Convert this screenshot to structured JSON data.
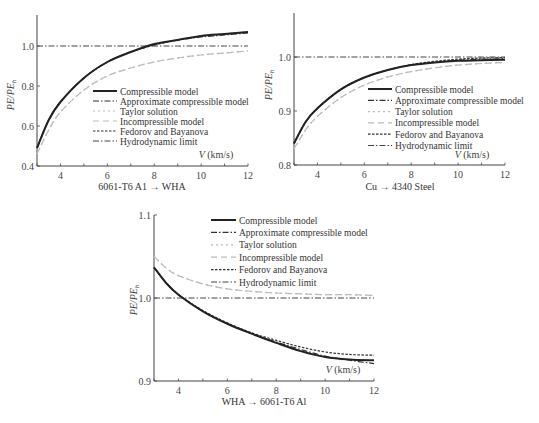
{
  "legend": [
    {
      "label": "Compressible model",
      "style": "solid",
      "color": "#222222",
      "width": 2
    },
    {
      "label": "Approximate compressible model",
      "style": "dashdot",
      "color": "#333333",
      "width": 1.2
    },
    {
      "label": "Taylor solution",
      "style": "dotted",
      "color": "#bbbbbb",
      "width": 1.2
    },
    {
      "label": "Incompressible model",
      "style": "dashed",
      "color": "#bbbbbb",
      "width": 1.2
    },
    {
      "label": "Fedorov and Bayanova",
      "style": "shortdash",
      "color": "#333333",
      "width": 1.2
    },
    {
      "label": "Hydrodynamic limit",
      "style": "dashdot",
      "color": "#444444",
      "width": 1
    }
  ],
  "chart_data": [
    {
      "type": "line",
      "title": "6061-T6 A1 → WHA",
      "xlabel": "V (km/s)",
      "ylabel": "PE/PE_h",
      "xlim": [
        3,
        12
      ],
      "ylim": [
        0.4,
        1.15
      ],
      "xticks": [
        4,
        6,
        8,
        10,
        12
      ],
      "yticks": [
        "0.4",
        "0.6",
        "0.8",
        "1.0"
      ],
      "grid": false,
      "legend_position": "lower right",
      "x": [
        3,
        3.5,
        4,
        5,
        6,
        7,
        8,
        9,
        10,
        11,
        12
      ],
      "series": [
        {
          "name": "Compressible model",
          "values": [
            0.49,
            0.63,
            0.72,
            0.84,
            0.92,
            0.97,
            1.01,
            1.03,
            1.05,
            1.06,
            1.07
          ]
        },
        {
          "name": "Approximate compressible model",
          "values": [
            0.49,
            0.63,
            0.72,
            0.84,
            0.92,
            0.97,
            1.005,
            1.03,
            1.045,
            1.055,
            1.065
          ]
        },
        {
          "name": "Taylor solution",
          "values": [
            0.46,
            0.58,
            0.67,
            0.78,
            0.85,
            0.89,
            0.92,
            0.94,
            0.955,
            0.965,
            0.975
          ]
        },
        {
          "name": "Incompressible model",
          "values": [
            0.46,
            0.58,
            0.67,
            0.78,
            0.85,
            0.89,
            0.92,
            0.94,
            0.955,
            0.965,
            0.975
          ]
        },
        {
          "name": "Fedorov and Bayanova",
          "values": [
            0.49,
            0.63,
            0.72,
            0.84,
            0.92,
            0.97,
            1.005,
            1.03,
            1.05,
            1.06,
            1.07
          ]
        },
        {
          "name": "Hydrodynamic limit",
          "values": [
            1.0,
            1.0,
            1.0,
            1.0,
            1.0,
            1.0,
            1.0,
            1.0,
            1.0,
            1.0,
            1.0
          ]
        }
      ]
    },
    {
      "type": "line",
      "title": "Cu → 4340 Steel",
      "xlabel": "V (km/s)",
      "ylabel": "PE/PE_h",
      "xlim": [
        3,
        12
      ],
      "ylim": [
        0.8,
        1.08
      ],
      "xticks": [
        4,
        6,
        8,
        10,
        12
      ],
      "yticks": [
        "0.8",
        "0.9",
        "1.0"
      ],
      "grid": false,
      "legend_position": "lower right",
      "x": [
        3,
        3.5,
        4,
        5,
        6,
        7,
        8,
        9,
        10,
        11,
        12
      ],
      "series": [
        {
          "name": "Compressible model",
          "values": [
            0.84,
            0.88,
            0.905,
            0.94,
            0.962,
            0.976,
            0.985,
            0.99,
            0.993,
            0.994,
            0.995
          ]
        },
        {
          "name": "Approximate compressible model",
          "values": [
            0.84,
            0.88,
            0.905,
            0.94,
            0.962,
            0.976,
            0.985,
            0.99,
            0.994,
            0.996,
            0.997
          ]
        },
        {
          "name": "Taylor solution",
          "values": [
            0.83,
            0.865,
            0.89,
            0.925,
            0.948,
            0.963,
            0.973,
            0.98,
            0.985,
            0.988,
            0.99
          ]
        },
        {
          "name": "Incompressible model",
          "values": [
            0.83,
            0.865,
            0.89,
            0.925,
            0.948,
            0.963,
            0.973,
            0.98,
            0.985,
            0.988,
            0.99
          ]
        },
        {
          "name": "Fedorov and Bayanova",
          "values": [
            0.84,
            0.88,
            0.905,
            0.94,
            0.962,
            0.976,
            0.986,
            0.992,
            0.996,
            0.998,
            0.999
          ]
        },
        {
          "name": "Hydrodynamic limit",
          "values": [
            1.0,
            1.0,
            1.0,
            1.0,
            1.0,
            1.0,
            1.0,
            1.0,
            1.0,
            1.0,
            1.0
          ]
        }
      ]
    },
    {
      "type": "line",
      "title": "WHA → 6061-T6 Al",
      "xlabel": "V (km/s)",
      "ylabel": "PE/PE_h",
      "xlim": [
        3,
        12
      ],
      "ylim": [
        0.9,
        1.1
      ],
      "xticks": [
        4,
        6,
        8,
        10,
        12
      ],
      "yticks": [
        "0.9",
        "1.0",
        "1.1"
      ],
      "grid": false,
      "legend_position": "upper right",
      "x": [
        3,
        3.5,
        4,
        5,
        6,
        7,
        8,
        9,
        10,
        11,
        12
      ],
      "series": [
        {
          "name": "Compressible model",
          "values": [
            1.037,
            1.018,
            1.004,
            0.984,
            0.969,
            0.957,
            0.946,
            0.936,
            0.929,
            0.926,
            0.925
          ]
        },
        {
          "name": "Approximate compressible model",
          "values": [
            1.037,
            1.018,
            1.004,
            0.984,
            0.969,
            0.957,
            0.947,
            0.938,
            0.93,
            0.925,
            0.921
          ]
        },
        {
          "name": "Taylor solution",
          "values": [
            1.05,
            1.036,
            1.027,
            1.017,
            1.011,
            1.008,
            1.006,
            1.005,
            1.004,
            1.004,
            1.003
          ]
        },
        {
          "name": "Incompressible model",
          "values": [
            1.05,
            1.036,
            1.027,
            1.017,
            1.011,
            1.008,
            1.006,
            1.005,
            1.004,
            1.004,
            1.003
          ]
        },
        {
          "name": "Fedorov and Bayanova",
          "values": [
            1.037,
            1.018,
            1.004,
            0.985,
            0.97,
            0.958,
            0.949,
            0.941,
            0.935,
            0.932,
            0.931
          ]
        },
        {
          "name": "Hydrodynamic limit",
          "values": [
            1.0,
            1.0,
            1.0,
            1.0,
            1.0,
            1.0,
            1.0,
            1.0,
            1.0,
            1.0,
            1.0
          ]
        }
      ]
    }
  ],
  "panels": [
    {
      "caption": "6061-T6 A1 → WHA",
      "xunit": "(km/s)",
      "xvar": "V",
      "ylabel_main": "PE/PE",
      "ylabel_sub": "h"
    },
    {
      "caption": "Cu → 4340 Steel",
      "xunit": "(km/s)",
      "xvar": "V",
      "ylabel_main": "PE/PE",
      "ylabel_sub": "h"
    },
    {
      "caption": "WHA → 6061-T6 Al",
      "xunit": "(km/s)",
      "xvar": "V",
      "ylabel_main": "PE/PE",
      "ylabel_sub": "h"
    }
  ]
}
